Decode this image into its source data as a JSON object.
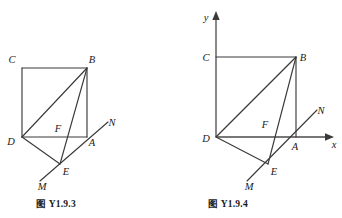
{
  "page": {
    "width": 342,
    "height": 218,
    "background": "#ffffff",
    "ink_color": "#3a3a3a"
  },
  "figures": [
    {
      "id": "fig-left",
      "caption": "图 Y1.9.3",
      "has_axes": false,
      "vertex_labels": [
        "C",
        "B",
        "D",
        "F",
        "A",
        "N",
        "E",
        "M"
      ],
      "points": {
        "C": {
          "x": 22,
          "y": 68,
          "label": "C",
          "label_x": 12,
          "label_y": 63
        },
        "B": {
          "x": 87,
          "y": 68,
          "label": "B",
          "label_x": 91,
          "label_y": 63
        },
        "D": {
          "x": 22,
          "y": 137,
          "label": "D",
          "label_x": 10,
          "label_y": 145
        },
        "A": {
          "x": 87,
          "y": 137,
          "label": "A",
          "label_x": 91,
          "label_y": 146
        },
        "E": {
          "x": 60,
          "y": 164,
          "label": "E",
          "label_x": 63,
          "label_y": 174
        },
        "F": {
          "x": 64,
          "y": 133,
          "label": "F",
          "label_x": 57,
          "label_y": 131
        },
        "M": {
          "x": 41,
          "y": 179,
          "label": "M",
          "label_x": 41,
          "label_y": 188
        },
        "N": {
          "x": 107,
          "y": 123,
          "label": "N",
          "label_x": 108,
          "label_y": 124
        }
      },
      "segments": [
        {
          "name": "side-CB",
          "from": "C",
          "to": "B"
        },
        {
          "name": "side-CD",
          "from": "C",
          "to": "D"
        },
        {
          "name": "side-DA",
          "from": "D",
          "to": "A"
        },
        {
          "name": "side-AB",
          "from": "A",
          "to": "B"
        },
        {
          "name": "diagonal-DB",
          "from": "D",
          "to": "B"
        },
        {
          "name": "segment-BE",
          "from": "B",
          "to": "E"
        },
        {
          "name": "segment-DE",
          "from": "D",
          "to": "E"
        },
        {
          "name": "line-MN",
          "from": "M",
          "to": "N"
        }
      ]
    },
    {
      "id": "fig-right",
      "caption": "图 Y1.9.4",
      "has_axes": true,
      "axes": {
        "x_label": "x",
        "y_label": "y",
        "x_label_x": 333,
        "x_label_y": 147,
        "y_label_x": 206,
        "y_label_y": 20,
        "origin_x": 216,
        "origin_y": 137,
        "x_end": 331,
        "y_end": 14
      },
      "vertex_labels": [
        "C",
        "B",
        "D",
        "F",
        "A",
        "N",
        "E",
        "M"
      ],
      "points": {
        "C": {
          "x": 216,
          "y": 57,
          "label": "C",
          "label_x": 205,
          "label_y": 62
        },
        "B": {
          "x": 296,
          "y": 57,
          "label": "B",
          "label_x": 301,
          "label_y": 62
        },
        "D": {
          "x": 216,
          "y": 137,
          "label": "D",
          "label_x": 204,
          "label_y": 142
        },
        "A": {
          "x": 296,
          "y": 137,
          "label": "A",
          "label_x": 293,
          "label_y": 149
        },
        "E": {
          "x": 268,
          "y": 164,
          "label": "E",
          "label_x": 271,
          "label_y": 174
        },
        "F": {
          "x": 272,
          "y": 130,
          "label": "F",
          "label_x": 264,
          "label_y": 127
        },
        "M": {
          "x": 248,
          "y": 179,
          "label": "M",
          "label_x": 247,
          "label_y": 189
        },
        "N": {
          "x": 316,
          "y": 112,
          "label": "N",
          "label_x": 317,
          "label_y": 114
        }
      },
      "segments": [
        {
          "name": "side-CB",
          "from": "C",
          "to": "B"
        },
        {
          "name": "side-DA",
          "from": "D",
          "to": "A"
        },
        {
          "name": "side-AB",
          "from": "A",
          "to": "B"
        },
        {
          "name": "diagonal-DB",
          "from": "D",
          "to": "B"
        },
        {
          "name": "segment-BE",
          "from": "B",
          "to": "E"
        },
        {
          "name": "segment-DE",
          "from": "D",
          "to": "E"
        },
        {
          "name": "line-MN",
          "from": "M",
          "to": "N"
        }
      ]
    }
  ]
}
